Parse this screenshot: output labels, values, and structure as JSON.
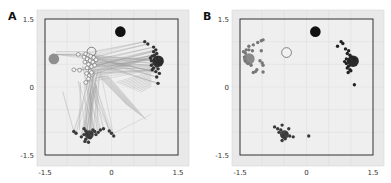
{
  "chart_data": [
    {
      "panel_label": "A",
      "type": "scatter",
      "title": "",
      "xlabel": "",
      "ylabel": "",
      "xlim": [
        -1.5,
        1.5
      ],
      "ylim": [
        -1.5,
        1.5
      ],
      "xticks": [
        "-1.5",
        "0",
        "1.5"
      ],
      "yticks": [
        "1.5",
        "0",
        "-1.5"
      ],
      "grid": true,
      "legend": null,
      "anchors": [
        {
          "name": "black-target",
          "x": 0.2,
          "y": 1.22,
          "r": 0.12,
          "fill": "#111111",
          "stroke": "none"
        },
        {
          "name": "gray-target",
          "x": -1.3,
          "y": 0.62,
          "r": 0.12,
          "fill": "#8f8f8f",
          "stroke": "none"
        },
        {
          "name": "right-target",
          "x": 1.05,
          "y": 0.57,
          "r": 0.13,
          "fill": "#2b2b2b",
          "stroke": "none"
        },
        {
          "name": "bottom-target",
          "x": -0.5,
          "y": -1.05,
          "r": 0.1,
          "fill": "#444444",
          "stroke": "none"
        },
        {
          "name": "open-target",
          "x": -0.45,
          "y": 0.78,
          "r": 0.1,
          "fill": "none",
          "stroke": "#555555"
        }
      ],
      "series": [
        {
          "name": "open-circles",
          "style": "open",
          "color": "#666666",
          "points": [
            [
              -0.75,
              0.72
            ],
            [
              -0.58,
              0.73
            ],
            [
              -0.52,
              0.7
            ],
            [
              -0.47,
              0.68
            ],
            [
              -0.4,
              0.65
            ],
            [
              -0.55,
              0.62
            ],
            [
              -0.48,
              0.58
            ],
            [
              -0.6,
              0.55
            ],
            [
              -0.42,
              0.55
            ],
            [
              -0.52,
              0.5
            ],
            [
              -0.45,
              0.45
            ],
            [
              -0.38,
              0.48
            ],
            [
              -0.85,
              0.38
            ],
            [
              -0.72,
              0.37
            ],
            [
              -0.55,
              0.42
            ],
            [
              -0.48,
              0.35
            ],
            [
              -0.56,
              0.3
            ],
            [
              -0.5,
              0.25
            ],
            [
              -0.44,
              0.28
            ],
            [
              -0.52,
              0.18
            ],
            [
              -0.58,
              0.1
            ],
            [
              -0.35,
              0.6
            ],
            [
              -0.62,
              0.66
            ],
            [
              -0.45,
              0.32
            ]
          ]
        },
        {
          "name": "right-cluster",
          "style": "filled",
          "color": "#333333",
          "points": [
            [
              0.75,
              1.0
            ],
            [
              0.82,
              0.95
            ],
            [
              0.95,
              0.88
            ],
            [
              1.0,
              0.82
            ],
            [
              0.95,
              0.78
            ],
            [
              1.02,
              0.74
            ],
            [
              0.92,
              0.68
            ],
            [
              1.0,
              0.62
            ],
            [
              0.9,
              0.58
            ],
            [
              0.96,
              0.52
            ],
            [
              0.9,
              0.48
            ],
            [
              1.02,
              0.46
            ],
            [
              0.95,
              0.42
            ],
            [
              0.92,
              0.38
            ],
            [
              1.05,
              0.4
            ],
            [
              1.0,
              0.34
            ],
            [
              1.08,
              0.3
            ],
            [
              1.02,
              0.22
            ],
            [
              1.05,
              0.08
            ],
            [
              0.97,
              0.7
            ],
            [
              1.08,
              0.64
            ],
            [
              0.88,
              0.64
            ]
          ]
        },
        {
          "name": "bottom-cluster",
          "style": "filled",
          "color": "#3a3a3a",
          "points": [
            [
              -0.85,
              -0.98
            ],
            [
              -0.8,
              -1.02
            ],
            [
              -0.62,
              -0.92
            ],
            [
              -0.58,
              -0.97
            ],
            [
              -0.55,
              -1.02
            ],
            [
              -0.62,
              -1.05
            ],
            [
              -0.52,
              -1.08
            ],
            [
              -0.45,
              -1.02
            ],
            [
              -0.42,
              -0.95
            ],
            [
              -0.38,
              -0.98
            ],
            [
              -0.48,
              -1.12
            ],
            [
              -0.58,
              -1.15
            ],
            [
              -0.68,
              -1.1
            ],
            [
              -0.6,
              -1.2
            ],
            [
              -0.52,
              -1.22
            ],
            [
              -0.35,
              -1.05
            ],
            [
              -0.25,
              -0.95
            ],
            [
              -0.18,
              -0.92
            ],
            [
              -0.05,
              -0.97
            ],
            [
              0.0,
              -1.02
            ],
            [
              0.05,
              -1.08
            ],
            [
              -0.3,
              -1.0
            ]
          ]
        }
      ],
      "lines": "many thin gray lines connect open circles to right and bottom clusters"
    },
    {
      "panel_label": "B",
      "type": "scatter",
      "title": "",
      "xlabel": "",
      "ylabel": "",
      "xlim": [
        -1.5,
        1.5
      ],
      "ylim": [
        -1.5,
        1.5
      ],
      "xticks": [
        "-1.5",
        "0",
        "1.5"
      ],
      "yticks": [
        "1.5",
        "0",
        "-1.5"
      ],
      "grid": true,
      "legend": null,
      "anchors": [
        {
          "name": "black-target",
          "x": 0.2,
          "y": 1.22,
          "r": 0.12,
          "fill": "#111111",
          "stroke": "none"
        },
        {
          "name": "gray-target",
          "x": -1.3,
          "y": 0.62,
          "r": 0.13,
          "fill": "#8a8a8a",
          "stroke": "none"
        },
        {
          "name": "right-target",
          "x": 1.05,
          "y": 0.57,
          "r": 0.13,
          "fill": "#2b2b2b",
          "stroke": "none"
        },
        {
          "name": "bottom-target",
          "x": -0.5,
          "y": -1.05,
          "r": 0.1,
          "fill": "#444444",
          "stroke": "none"
        },
        {
          "name": "open-target",
          "x": -0.45,
          "y": 0.76,
          "r": 0.11,
          "fill": "#f2f2f2",
          "stroke": "#555555"
        }
      ],
      "series": [
        {
          "name": "left-cluster",
          "style": "filled",
          "color": "#777777",
          "points": [
            [
              -1.42,
              0.78
            ],
            [
              -1.36,
              0.82
            ],
            [
              -1.3,
              0.82
            ],
            [
              -1.22,
              0.8
            ],
            [
              -1.38,
              0.75
            ],
            [
              -1.3,
              0.9
            ],
            [
              -1.2,
              0.93
            ],
            [
              -1.1,
              0.98
            ],
            [
              -1.02,
              1.02
            ],
            [
              -0.98,
              1.04
            ],
            [
              -1.02,
              0.8
            ],
            [
              -1.05,
              0.58
            ],
            [
              -1.0,
              0.53
            ],
            [
              -0.98,
              0.48
            ],
            [
              -1.12,
              0.38
            ],
            [
              -1.15,
              0.34
            ],
            [
              -1.2,
              0.32
            ],
            [
              -0.98,
              0.33
            ],
            [
              -1.4,
              0.66
            ],
            [
              -1.38,
              0.58
            ],
            [
              -1.25,
              0.48
            ],
            [
              -1.32,
              0.52
            ]
          ]
        },
        {
          "name": "right-cluster",
          "style": "filled",
          "color": "#222222",
          "points": [
            [
              0.7,
              0.9
            ],
            [
              0.78,
              1.0
            ],
            [
              0.82,
              0.96
            ],
            [
              0.88,
              0.84
            ],
            [
              0.95,
              0.8
            ],
            [
              0.92,
              0.74
            ],
            [
              0.98,
              0.7
            ],
            [
              1.02,
              0.66
            ],
            [
              0.9,
              0.62
            ],
            [
              0.95,
              0.58
            ],
            [
              0.9,
              0.52
            ],
            [
              0.95,
              0.46
            ],
            [
              0.92,
              0.42
            ],
            [
              0.98,
              0.38
            ],
            [
              0.94,
              0.32
            ],
            [
              1.0,
              0.36
            ],
            [
              1.08,
              0.05
            ],
            [
              0.86,
              0.56
            ],
            [
              1.08,
              0.62
            ]
          ]
        },
        {
          "name": "bottom-cluster",
          "style": "filled",
          "color": "#3a3a3a",
          "points": [
            [
              -0.72,
              -0.88
            ],
            [
              -0.65,
              -0.92
            ],
            [
              -0.55,
              -0.84
            ],
            [
              -0.58,
              -0.95
            ],
            [
              -0.62,
              -1.0
            ],
            [
              -0.52,
              -1.08
            ],
            [
              -0.45,
              -1.02
            ],
            [
              -0.4,
              -0.92
            ],
            [
              -0.38,
              -1.08
            ],
            [
              -0.3,
              -1.1
            ],
            [
              -0.55,
              -1.18
            ],
            [
              -0.48,
              -1.14
            ],
            [
              0.05,
              -1.08
            ]
          ]
        }
      ]
    }
  ]
}
